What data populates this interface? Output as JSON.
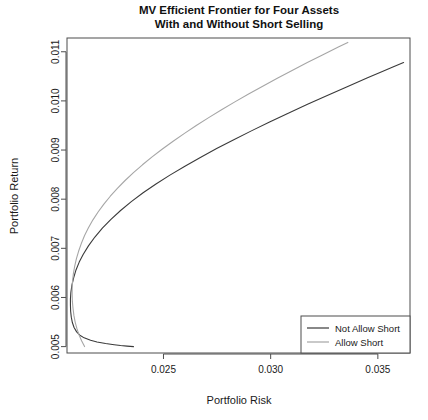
{
  "chart_data": {
    "type": "line",
    "title": "MV Efficient Frontier for Four Assets\nWith and Without Short Selling",
    "title_line1": "MV Efficient Frontier for Four Assets",
    "title_line2": "With and Without Short Selling",
    "xlabel": "Portfolio Risk",
    "ylabel": "Portfolio Return",
    "xlim": [
      0.0205,
      0.0365
    ],
    "ylim": [
      0.00487,
      0.01128
    ],
    "xticks": [
      0.025,
      0.03,
      0.035
    ],
    "xtick_labels": [
      "0.025",
      "0.030",
      "0.035"
    ],
    "yticks": [
      0.005,
      0.006,
      0.007,
      0.008,
      0.009,
      0.01,
      0.011
    ],
    "ytick_labels": [
      "0.005",
      "0.006",
      "0.007",
      "0.008",
      "0.009",
      "0.010",
      "0.011"
    ],
    "grid": false,
    "legend_position": "bottom-right",
    "series": [
      {
        "name": "Not Allow Short",
        "color": "#3a3a3a",
        "points": [
          [
            0.0236,
            0.005
          ],
          [
            0.0233,
            0.00501
          ],
          [
            0.023,
            0.005022
          ],
          [
            0.0227,
            0.005038
          ],
          [
            0.0223,
            0.005062
          ],
          [
            0.0219,
            0.005094
          ],
          [
            0.0216,
            0.005128
          ],
          [
            0.0213,
            0.005178
          ],
          [
            0.0211,
            0.005232
          ],
          [
            0.02095,
            0.0053
          ],
          [
            0.02083,
            0.00539
          ],
          [
            0.02075,
            0.00549
          ],
          [
            0.0207,
            0.0056
          ],
          [
            0.02067,
            0.00572
          ],
          [
            0.02066,
            0.00585
          ],
          [
            0.02066,
            0.00597
          ],
          [
            0.02068,
            0.0061
          ],
          [
            0.02073,
            0.00625
          ],
          [
            0.02081,
            0.0064
          ],
          [
            0.02092,
            0.00656
          ],
          [
            0.02107,
            0.00672
          ],
          [
            0.02126,
            0.00688
          ],
          [
            0.0215,
            0.00705
          ],
          [
            0.0218,
            0.00723
          ],
          [
            0.02215,
            0.00741
          ],
          [
            0.02255,
            0.00759
          ],
          [
            0.023,
            0.00777
          ],
          [
            0.0235,
            0.00795
          ],
          [
            0.02405,
            0.00813
          ],
          [
            0.02465,
            0.00831
          ],
          [
            0.0253,
            0.00849
          ],
          [
            0.026,
            0.00867
          ],
          [
            0.02672,
            0.00885
          ],
          [
            0.02748,
            0.00903
          ],
          [
            0.02828,
            0.00921
          ],
          [
            0.0291,
            0.00939
          ],
          [
            0.02995,
            0.00957
          ],
          [
            0.03082,
            0.00975
          ],
          [
            0.03172,
            0.00993
          ],
          [
            0.03264,
            0.01011
          ],
          [
            0.03357,
            0.01029
          ],
          [
            0.03452,
            0.01047
          ],
          [
            0.0351,
            0.01058
          ],
          [
            0.0357,
            0.01069
          ],
          [
            0.0362,
            0.01078
          ]
        ]
      },
      {
        "name": "Allow Short",
        "color": "#a6a6a6",
        "points": [
          [
            0.02132,
            0.005
          ],
          [
            0.02118,
            0.00512
          ],
          [
            0.02106,
            0.00524
          ],
          [
            0.02096,
            0.00537
          ],
          [
            0.02088,
            0.0055
          ],
          [
            0.02082,
            0.00564
          ],
          [
            0.02078,
            0.00578
          ],
          [
            0.02075,
            0.00592
          ],
          [
            0.02074,
            0.00606
          ],
          [
            0.02074,
            0.0062
          ],
          [
            0.02076,
            0.00634
          ],
          [
            0.0208,
            0.00649
          ],
          [
            0.02086,
            0.00664
          ],
          [
            0.02094,
            0.00679
          ],
          [
            0.02104,
            0.00694
          ],
          [
            0.02117,
            0.0071
          ],
          [
            0.02132,
            0.00726
          ],
          [
            0.0215,
            0.00742
          ],
          [
            0.02171,
            0.00758
          ],
          [
            0.02195,
            0.00774
          ],
          [
            0.02222,
            0.0079
          ],
          [
            0.02252,
            0.00806
          ],
          [
            0.02285,
            0.00822
          ],
          [
            0.02321,
            0.00838
          ],
          [
            0.0236,
            0.00854
          ],
          [
            0.02402,
            0.0087
          ],
          [
            0.02447,
            0.00886
          ],
          [
            0.02495,
            0.00902
          ],
          [
            0.02545,
            0.00918
          ],
          [
            0.02598,
            0.00934
          ],
          [
            0.02653,
            0.0095
          ],
          [
            0.02711,
            0.00966
          ],
          [
            0.02771,
            0.00982
          ],
          [
            0.02833,
            0.00998
          ],
          [
            0.02897,
            0.01014
          ],
          [
            0.02963,
            0.0103
          ],
          [
            0.03031,
            0.01046
          ],
          [
            0.031,
            0.01062
          ],
          [
            0.03171,
            0.01078
          ],
          [
            0.03244,
            0.01094
          ],
          [
            0.03318,
            0.0111
          ],
          [
            0.0336,
            0.01119
          ]
        ]
      }
    ],
    "legend": {
      "entries": [
        {
          "label": "Not Allow Short",
          "color": "#3a3a3a"
        },
        {
          "label": "Allow Short",
          "color": "#a6a6a6"
        }
      ]
    }
  }
}
